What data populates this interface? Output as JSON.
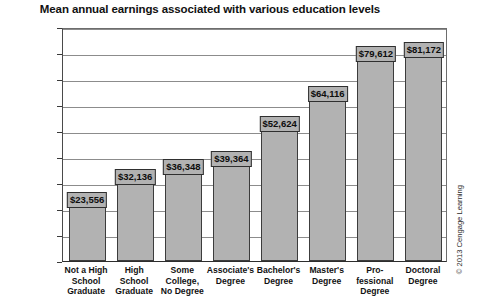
{
  "chart_data": {
    "type": "bar",
    "title": "Mean annual earnings associated with various education levels",
    "xlabel": "",
    "ylabel": "",
    "ylim": [
      0,
      90000
    ],
    "grid": true,
    "legend": null,
    "categories": [
      "Not a High School Graduate",
      "High School Graduate",
      "Some College, No Degree",
      "Associate's Degree",
      "Bachelor's Degree",
      "Master's Degree",
      "Professional Degree",
      "Doctoral Degree"
    ],
    "category_lines": [
      [
        "Not a High",
        "School",
        "Graduate"
      ],
      [
        "High",
        "School",
        "Graduate"
      ],
      [
        "Some",
        "College,",
        "No Degree"
      ],
      [
        "Associate's",
        "Degree"
      ],
      [
        "Bachelor's",
        "Degree"
      ],
      [
        "Master's",
        "Degree"
      ],
      [
        "Pro-",
        "fessional",
        "Degree"
      ],
      [
        "Doctoral",
        "Degree"
      ]
    ],
    "values": [
      23556,
      32136,
      36348,
      39364,
      52624,
      64116,
      79612,
      81172
    ],
    "value_labels": [
      "$23,556",
      "$32,136",
      "$36,348",
      "$39,364",
      "$52,624",
      "$64,116",
      "$79,612",
      "$81,172"
    ],
    "ytick_values": [
      0,
      10000,
      20000,
      30000,
      40000,
      50000,
      60000,
      70000,
      80000,
      90000
    ],
    "ytick_labels": [
      "$0",
      "$10,000",
      "$20,000",
      "$30,000",
      "$40,000",
      "$50,000",
      "$60,000",
      "$70,000",
      "$80,000",
      "$90,000"
    ],
    "bar_color": "#b2b2b2",
    "bar_edge_color": "#3c3c3c",
    "grid_color": "#8c8c8c",
    "background_color": "#ffffff"
  },
  "credit": "© 2013 Cengage Learning"
}
